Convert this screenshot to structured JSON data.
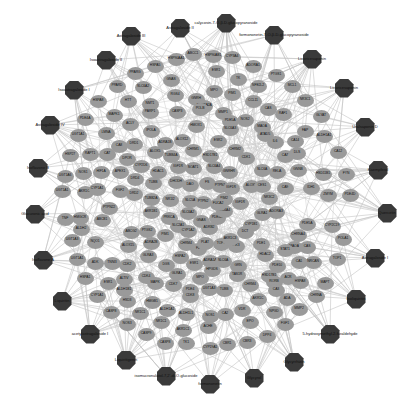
{
  "diagram": {
    "type": "compound-target network",
    "colors": {
      "compound": "#3a3a3a",
      "target": "#9a9a9a",
      "edge": "#c4c4c4",
      "background": "#ffffff"
    }
  },
  "compounds": [
    {
      "label": "Astragaloside III",
      "x": 131,
      "y": 36
    },
    {
      "label": "Astragaloside II",
      "x": 180,
      "y": 28
    },
    {
      "label": "calycosin-7-O-β-D-glucopyranoside",
      "x": 226,
      "y": 23
    },
    {
      "label": "formononetin-7-O-β-D-glucopyranoside",
      "x": 274,
      "y": 35
    },
    {
      "label": "Isoastragaloside II",
      "x": 106,
      "y": 60
    },
    {
      "label": "Isoastragaloside I",
      "x": 74,
      "y": 90
    },
    {
      "label": "Licoricesaponin",
      "x": 312,
      "y": 59
    },
    {
      "label": "Licoricesaponin",
      "x": 344,
      "y": 88
    },
    {
      "label": "Astragaloside IV",
      "x": 50,
      "y": 125
    },
    {
      "label": "Uralsaponin D",
      "x": 365,
      "y": 127
    },
    {
      "label": "Isoflavone B",
      "x": 38,
      "y": 168
    },
    {
      "label": "Kaempferol",
      "x": 378,
      "y": 170
    },
    {
      "label": "Glucuronic acid",
      "x": 35,
      "y": 214
    },
    {
      "label": "Quercetin",
      "x": 387,
      "y": 213
    },
    {
      "label": "Isoflavone A",
      "x": 43,
      "y": 260
    },
    {
      "label": "Astragaloside I",
      "x": 375,
      "y": 258
    },
    {
      "label": "Liquiritin",
      "x": 62,
      "y": 301
    },
    {
      "label": "Isoliquiritin",
      "x": 356,
      "y": 299
    },
    {
      "label": "acetylastragaloside I",
      "x": 90,
      "y": 334
    },
    {
      "label": "5-hydroxymethyl-2-furaldehyde",
      "x": 330,
      "y": 334
    },
    {
      "label": "Liquiritigenin",
      "x": 126,
      "y": 360
    },
    {
      "label": "Glycyrrhizin",
      "x": 294,
      "y": 362
    },
    {
      "label": "isomucronulatol-7,2'-di-O-glucoside",
      "x": 166,
      "y": 376
    },
    {
      "label": "Glycyrol",
      "x": 254,
      "y": 378
    },
    {
      "label": "formononetin",
      "x": 210,
      "y": 384
    }
  ],
  "targets": [
    {
      "label": "HSP90AA1",
      "x": 176,
      "y": 59
    },
    {
      "label": "ABCC1",
      "x": 193,
      "y": 54
    },
    {
      "label": "CYP3A4",
      "x": 232,
      "y": 57
    },
    {
      "label": "HSP90AB1",
      "x": 213,
      "y": 56
    },
    {
      "label": "ADORA1",
      "x": 253,
      "y": 66
    },
    {
      "label": "HSPA5",
      "x": 155,
      "y": 66
    },
    {
      "label": "PPARG",
      "x": 135,
      "y": 73
    },
    {
      "label": "ESR1",
      "x": 216,
      "y": 71
    },
    {
      "label": "TK",
      "x": 238,
      "y": 79
    },
    {
      "label": "PPARD",
      "x": 117,
      "y": 86
    },
    {
      "label": "SLC6A2",
      "x": 143,
      "y": 87
    },
    {
      "label": "GNAS",
      "x": 171,
      "y": 80
    },
    {
      "label": "MPO",
      "x": 214,
      "y": 91
    },
    {
      "label": "PIM1",
      "x": 232,
      "y": 94
    },
    {
      "label": "NFE2L2",
      "x": 258,
      "y": 86
    },
    {
      "label": "PTGS1",
      "x": 276,
      "y": 75
    },
    {
      "label": "HSPA8",
      "x": 98,
      "y": 101
    },
    {
      "label": "HTT",
      "x": 128,
      "y": 101
    },
    {
      "label": "RGS4",
      "x": 175,
      "y": 95
    },
    {
      "label": "GNRH",
      "x": 196,
      "y": 99
    },
    {
      "label": "MCL1",
      "x": 292,
      "y": 86
    },
    {
      "label": "NMT1",
      "x": 150,
      "y": 104
    },
    {
      "label": "CCL11",
      "x": 253,
      "y": 101
    },
    {
      "label": "ADORA2A",
      "x": 204,
      "y": 106
    },
    {
      "label": "MAPK1",
      "x": 114,
      "y": 115
    },
    {
      "label": "PDE4A",
      "x": 85,
      "y": 119
    },
    {
      "label": "PARP1",
      "x": 150,
      "y": 112
    },
    {
      "label": "CASP3",
      "x": 177,
      "y": 112
    },
    {
      "label": "POLB",
      "x": 200,
      "y": 109
    },
    {
      "label": "MMP1",
      "x": 223,
      "y": 113
    },
    {
      "label": "CAS",
      "x": 268,
      "y": 109
    },
    {
      "label": "NR3C1",
      "x": 305,
      "y": 100
    },
    {
      "label": "PDE5A",
      "x": 230,
      "y": 121
    },
    {
      "label": "ACLY",
      "x": 130,
      "y": 124
    },
    {
      "label": "IPOLA",
      "x": 151,
      "y": 131
    },
    {
      "label": "UGT1A1",
      "x": 78,
      "y": 135
    },
    {
      "label": "LMNA",
      "x": 106,
      "y": 133
    },
    {
      "label": "CA8",
      "x": 119,
      "y": 146
    },
    {
      "label": "HMOX1",
      "x": 196,
      "y": 126
    },
    {
      "label": "NOS2",
      "x": 245,
      "y": 120
    },
    {
      "label": "SLC6A3",
      "x": 230,
      "y": 129
    },
    {
      "label": "RAF1",
      "x": 283,
      "y": 114
    },
    {
      "label": "MAOA",
      "x": 262,
      "y": 127
    },
    {
      "label": "GLYAT",
      "x": 321,
      "y": 116
    },
    {
      "label": "DRD1",
      "x": 134,
      "y": 144
    },
    {
      "label": "ALOX12",
      "x": 182,
      "y": 140
    },
    {
      "label": "ADRA1B",
      "x": 165,
      "y": 143
    },
    {
      "label": "ATAD5",
      "x": 265,
      "y": 135
    },
    {
      "label": "ESR2",
      "x": 218,
      "y": 141
    },
    {
      "label": "IL6",
      "x": 275,
      "y": 142
    },
    {
      "label": "FAP",
      "x": 305,
      "y": 131
    },
    {
      "label": "CA14",
      "x": 295,
      "y": 141
    },
    {
      "label": "ALDH1A1",
      "x": 324,
      "y": 136
    },
    {
      "label": "HSP27",
      "x": 70,
      "y": 155
    },
    {
      "label": "RAPT1",
      "x": 90,
      "y": 154
    },
    {
      "label": "CAT",
      "x": 107,
      "y": 154
    },
    {
      "label": "DPOR",
      "x": 127,
      "y": 159
    },
    {
      "label": "ALOX5",
      "x": 155,
      "y": 152
    },
    {
      "label": "TUBB4A",
      "x": 171,
      "y": 156
    },
    {
      "label": "CHRM1",
      "x": 193,
      "y": 150
    },
    {
      "label": "HSD17B1",
      "x": 210,
      "y": 156
    },
    {
      "label": "CHRM2",
      "x": 235,
      "y": 150
    },
    {
      "label": "CDK1",
      "x": 246,
      "y": 158
    },
    {
      "label": "CA7",
      "x": 285,
      "y": 156
    },
    {
      "label": "DLS",
      "x": 297,
      "y": 153
    },
    {
      "label": "CA12",
      "x": 338,
      "y": 152
    },
    {
      "label": "HIF1A",
      "x": 101,
      "y": 172
    },
    {
      "label": "APEX1",
      "x": 120,
      "y": 172
    },
    {
      "label": "CYP2D6",
      "x": 141,
      "y": 166
    },
    {
      "label": "HDAC1",
      "x": 158,
      "y": 172
    },
    {
      "label": "IGF1R",
      "x": 178,
      "y": 167
    },
    {
      "label": "SOAT1",
      "x": 193,
      "y": 168
    },
    {
      "label": "SLC6A4",
      "x": 214,
      "y": 167
    },
    {
      "label": "GNRHR",
      "x": 229,
      "y": 172
    },
    {
      "label": "SLC6A",
      "x": 262,
      "y": 170
    },
    {
      "label": "RELA",
      "x": 277,
      "y": 172
    },
    {
      "label": "GNNB",
      "x": 298,
      "y": 170
    },
    {
      "label": "HSD11B1",
      "x": 323,
      "y": 174
    },
    {
      "label": "FYN",
      "x": 346,
      "y": 174
    },
    {
      "label": "UGT1A6",
      "x": 65,
      "y": 176
    },
    {
      "label": "NOS1",
      "x": 83,
      "y": 173
    },
    {
      "label": "DRD4",
      "x": 135,
      "y": 179
    },
    {
      "label": "TUBB",
      "x": 153,
      "y": 183
    },
    {
      "label": "DHODH",
      "x": 176,
      "y": 182
    },
    {
      "label": "DAO",
      "x": 190,
      "y": 185
    },
    {
      "label": "FS",
      "x": 207,
      "y": 183
    },
    {
      "label": "PTPN1",
      "x": 220,
      "y": 186
    },
    {
      "label": "IGF1R",
      "x": 231,
      "y": 188
    },
    {
      "label": "ALOX5",
      "x": 251,
      "y": 186
    },
    {
      "label": "CES1",
      "x": 262,
      "y": 186
    },
    {
      "label": "CA9",
      "x": 285,
      "y": 188
    },
    {
      "label": "IDH1",
      "x": 311,
      "y": 188
    },
    {
      "label": "UGT1A1",
      "x": 62,
      "y": 191
    },
    {
      "label": "AKR1C1",
      "x": 85,
      "y": 192
    },
    {
      "label": "CYP1A1",
      "x": 97,
      "y": 189
    },
    {
      "label": "FGF2",
      "x": 120,
      "y": 191
    },
    {
      "label": "DRD2",
      "x": 134,
      "y": 194
    },
    {
      "label": "TUBB2A",
      "x": 151,
      "y": 199
    },
    {
      "label": "NR1I2",
      "x": 170,
      "y": 200
    },
    {
      "label": "SLC5A",
      "x": 190,
      "y": 201
    },
    {
      "label": "PTPN2",
      "x": 203,
      "y": 202
    },
    {
      "label": "PIM2",
      "x": 224,
      "y": 199
    },
    {
      "label": "IGF1R",
      "x": 240,
      "y": 203
    },
    {
      "label": "NR3C2",
      "x": 269,
      "y": 198
    },
    {
      "label": "ZMYM",
      "x": 328,
      "y": 195
    },
    {
      "label": "PDE4D",
      "x": 350,
      "y": 195
    },
    {
      "label": "TNF",
      "x": 65,
      "y": 219
    },
    {
      "label": "HMGCR",
      "x": 80,
      "y": 218
    },
    {
      "label": "ABCB1",
      "x": 102,
      "y": 220
    },
    {
      "label": "PTPN22",
      "x": 109,
      "y": 208
    },
    {
      "label": "AKR1B1",
      "x": 151,
      "y": 212
    },
    {
      "label": "PRKCA",
      "x": 169,
      "y": 218
    },
    {
      "label": "SLC6A2",
      "x": 188,
      "y": 213
    },
    {
      "label": "GNAS",
      "x": 201,
      "y": 221
    },
    {
      "label": "PDE3A",
      "x": 217,
      "y": 218
    },
    {
      "label": "SLC6A4",
      "x": 224,
      "y": 211
    },
    {
      "label": "GLRA1",
      "x": 262,
      "y": 214
    },
    {
      "label": "ADORA3",
      "x": 276,
      "y": 212
    },
    {
      "label": "FUCA2",
      "x": 218,
      "y": 204
    },
    {
      "label": "ALDH2",
      "x": 81,
      "y": 229
    },
    {
      "label": "ABCG2",
      "x": 131,
      "y": 232
    },
    {
      "label": "PTGS2",
      "x": 147,
      "y": 231
    },
    {
      "label": "PIM1",
      "x": 165,
      "y": 235
    },
    {
      "label": "SLC2A1",
      "x": 178,
      "y": 226
    },
    {
      "label": "CYP1A2",
      "x": 188,
      "y": 231
    },
    {
      "label": "ADRB2",
      "x": 209,
      "y": 228
    },
    {
      "label": "CYP1B1",
      "x": 251,
      "y": 225
    },
    {
      "label": "DCT",
      "x": 245,
      "y": 232
    },
    {
      "label": "PDE5A",
      "x": 307,
      "y": 224
    },
    {
      "label": "CHRNA4",
      "x": 298,
      "y": 235
    },
    {
      "label": "CYP2C19",
      "x": 332,
      "y": 226
    },
    {
      "label": "POLA1",
      "x": 343,
      "y": 239
    },
    {
      "label": "UGT1A3",
      "x": 72,
      "y": 240
    },
    {
      "label": "NQO1",
      "x": 95,
      "y": 242
    },
    {
      "label": "ADRA2B",
      "x": 151,
      "y": 243
    },
    {
      "label": "ALOX15",
      "x": 128,
      "y": 246
    },
    {
      "label": "CHRM4",
      "x": 186,
      "y": 244
    },
    {
      "label": "F2",
      "x": 198,
      "y": 249
    },
    {
      "label": "PLAT",
      "x": 205,
      "y": 243
    },
    {
      "label": "TOP1",
      "x": 221,
      "y": 244
    },
    {
      "label": "PIK3",
      "x": 236,
      "y": 246
    },
    {
      "label": "AKR1C3",
      "x": 230,
      "y": 239
    },
    {
      "label": "MAOA",
      "x": 294,
      "y": 247
    },
    {
      "label": "CAS",
      "x": 307,
      "y": 247
    },
    {
      "label": "STAT1",
      "x": 285,
      "y": 250
    },
    {
      "label": "PDE1",
      "x": 261,
      "y": 244
    },
    {
      "label": "UGT1A1",
      "x": 77,
      "y": 259
    },
    {
      "label": "ADK",
      "x": 95,
      "y": 263
    },
    {
      "label": "TNNI3",
      "x": 112,
      "y": 263
    },
    {
      "label": "CDK2",
      "x": 127,
      "y": 265
    },
    {
      "label": "GLRA3",
      "x": 148,
      "y": 256
    },
    {
      "label": "HSPA2",
      "x": 180,
      "y": 257
    },
    {
      "label": "DGS",
      "x": 166,
      "y": 265
    },
    {
      "label": "ESR1",
      "x": 194,
      "y": 264
    },
    {
      "label": "ADRA1A",
      "x": 210,
      "y": 261
    },
    {
      "label": "SLC6A",
      "x": 223,
      "y": 261
    },
    {
      "label": "GRN",
      "x": 238,
      "y": 266
    },
    {
      "label": "HDAC2",
      "x": 265,
      "y": 255
    },
    {
      "label": "PDE10",
      "x": 277,
      "y": 266
    },
    {
      "label": "CA1",
      "x": 299,
      "y": 262
    },
    {
      "label": "NRCAN",
      "x": 313,
      "y": 262
    },
    {
      "label": "TOP1",
      "x": 337,
      "y": 259
    },
    {
      "label": "HSPA1",
      "x": 85,
      "y": 278
    },
    {
      "label": "ESR1",
      "x": 108,
      "y": 283
    },
    {
      "label": "ALTIV",
      "x": 124,
      "y": 279
    },
    {
      "label": "CDK4",
      "x": 146,
      "y": 277
    },
    {
      "label": "GLRA1",
      "x": 177,
      "y": 274
    },
    {
      "label": "MPO",
      "x": 200,
      "y": 278
    },
    {
      "label": "MAPK",
      "x": 155,
      "y": 283
    },
    {
      "label": "HPGDS",
      "x": 212,
      "y": 270
    },
    {
      "label": "TAS1R",
      "x": 237,
      "y": 275
    },
    {
      "label": "HSD17B1",
      "x": 269,
      "y": 276
    },
    {
      "label": "RORB",
      "x": 274,
      "y": 282
    },
    {
      "label": "ACR",
      "x": 288,
      "y": 278
    },
    {
      "label": "HSPA8",
      "x": 300,
      "y": 282
    },
    {
      "label": "MAPT",
      "x": 325,
      "y": 283
    },
    {
      "label": "CYP1A1",
      "x": 97,
      "y": 296
    },
    {
      "label": "ALDH1B1",
      "x": 124,
      "y": 290
    },
    {
      "label": "CDK7",
      "x": 173,
      "y": 285
    },
    {
      "label": "PDE4",
      "x": 190,
      "y": 290
    },
    {
      "label": "UGT1A3",
      "x": 209,
      "y": 289
    },
    {
      "label": "TUBB",
      "x": 224,
      "y": 290
    },
    {
      "label": "CHRM4",
      "x": 250,
      "y": 285
    },
    {
      "label": "CA3",
      "x": 276,
      "y": 290
    },
    {
      "label": "ADA",
      "x": 287,
      "y": 299
    },
    {
      "label": "CHRNA",
      "x": 316,
      "y": 296
    },
    {
      "label": "CASP8",
      "x": 111,
      "y": 312
    },
    {
      "label": "HSD3",
      "x": 127,
      "y": 301
    },
    {
      "label": "HMGB1",
      "x": 152,
      "y": 302
    },
    {
      "label": "NR1C1",
      "x": 140,
      "y": 313
    },
    {
      "label": "ALDH1A1",
      "x": 167,
      "y": 310
    },
    {
      "label": "ALDH1L1",
      "x": 186,
      "y": 314
    },
    {
      "label": "CDK8",
      "x": 190,
      "y": 296
    },
    {
      "label": "AKR1C",
      "x": 258,
      "y": 299
    },
    {
      "label": "VDR",
      "x": 242,
      "y": 310
    },
    {
      "label": "NPGD",
      "x": 274,
      "y": 312
    },
    {
      "label": "MMP2",
      "x": 299,
      "y": 309
    },
    {
      "label": "NOS3",
      "x": 127,
      "y": 324
    },
    {
      "label": "NR1C1",
      "x": 161,
      "y": 322
    },
    {
      "label": "AKR1C1",
      "x": 183,
      "y": 330
    },
    {
      "label": "ACHE",
      "x": 208,
      "y": 327
    },
    {
      "label": "CA2",
      "x": 225,
      "y": 314
    },
    {
      "label": "EPO",
      "x": 250,
      "y": 322
    },
    {
      "label": "FGF1",
      "x": 285,
      "y": 324
    },
    {
      "label": "NOS1",
      "x": 210,
      "y": 316
    },
    {
      "label": "CASP9",
      "x": 146,
      "y": 334
    },
    {
      "label": "CASP8",
      "x": 165,
      "y": 343
    },
    {
      "label": "TK1",
      "x": 186,
      "y": 343
    },
    {
      "label": "CYP19A1",
      "x": 210,
      "y": 348
    },
    {
      "label": "CBR1",
      "x": 227,
      "y": 344
    },
    {
      "label": "CBR3",
      "x": 247,
      "y": 342
    },
    {
      "label": "DPP4",
      "x": 267,
      "y": 336
    }
  ]
}
